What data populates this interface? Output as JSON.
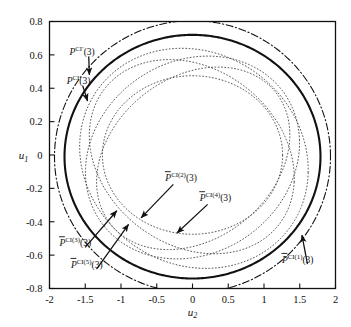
{
  "chart_data": {
    "type": "line",
    "title": "",
    "xlabel": "u2",
    "ylabel": "u1",
    "xlim": [
      -2,
      2
    ],
    "ylim": [
      -0.8,
      0.8
    ],
    "grid": false,
    "legend_position": "inline-annotations",
    "xticks": [
      "-2",
      "-1.5",
      "-1",
      "-0.5",
      "0",
      "0.5",
      "1",
      "1.5",
      "2"
    ],
    "xtick_values": [
      -2,
      -1.5,
      -1,
      -0.5,
      0,
      0.5,
      1,
      1.5,
      2
    ],
    "yticks": [
      "0.8",
      "0.6",
      "0.4",
      "0.2",
      "0",
      "-0.2",
      "-0.4",
      "-0.6",
      "-0.8"
    ],
    "ytick_values": [
      0.8,
      0.6,
      0.4,
      0.2,
      0,
      -0.2,
      -0.4,
      -0.6,
      -0.8
    ],
    "series": [
      {
        "name": "P^CI'(3)",
        "style": "dash-dot",
        "color": "#111111",
        "width": 1.1,
        "description": "outermost envelope, semi-axes a=1.93 b=0.815",
        "ellipse": {
          "cx": 0.0,
          "cy": -0.01,
          "rx": 1.93,
          "ry": 0.815,
          "rot": 0
        }
      },
      {
        "name": "P^CI(3)",
        "style": "solid",
        "color": "#111111",
        "width": 2.1,
        "description": "heavy solid inner envelope, semi-axes a=1.79 b=0.73",
        "ellipse": {
          "cx": 0.0,
          "cy": -0.01,
          "rx": 1.79,
          "ry": 0.73,
          "rot": 0
        }
      },
      {
        "name": "Pbar^CI(1)(3)",
        "style": "dotted",
        "color": "#444444",
        "width": 0.9,
        "ellipse": {
          "cx": 0.02,
          "cy": -0.02,
          "rx": 1.6,
          "ry": 0.655,
          "rot": -3
        }
      },
      {
        "name": "Pbar^CI(2)(3)",
        "style": "dotted",
        "color": "#444444",
        "width": 0.9,
        "ellipse": {
          "cx": 0.0,
          "cy": -0.015,
          "rx": 1.5,
          "ry": 0.6,
          "rot": 4
        }
      },
      {
        "name": "Pbar^CI(3)(3)",
        "style": "dotted",
        "color": "#444444",
        "width": 0.9,
        "ellipse": {
          "cx": -0.01,
          "cy": -0.01,
          "rx": 1.44,
          "ry": 0.565,
          "rot": -6
        }
      },
      {
        "name": "Pbar^CI(4)(3)",
        "style": "dotted",
        "color": "#444444",
        "width": 0.9,
        "ellipse": {
          "cx": 0.01,
          "cy": -0.02,
          "rx": 1.36,
          "ry": 0.525,
          "rot": 7
        }
      },
      {
        "name": "Pbar^CI(5)(3)",
        "style": "dotted",
        "color": "#444444",
        "width": 0.9,
        "ellipse": {
          "cx": 0.0,
          "cy": 0.0,
          "rx": 1.26,
          "ry": 0.475,
          "rot": 0
        }
      }
    ],
    "annotations": [
      {
        "id": "a1",
        "base": "P",
        "sup": "CI′",
        "arg": "(3)",
        "overbar": false,
        "text": "P^CI'(3)",
        "label_xy": [
          -1.72,
          0.6
        ],
        "arrow_to": [
          -1.44,
          0.455
        ]
      },
      {
        "id": "a2",
        "base": "P",
        "sup": "CI",
        "arg": "(3)",
        "overbar": false,
        "text": "P^CI(3)",
        "label_xy": [
          -1.76,
          0.425
        ],
        "arrow_to": [
          -1.45,
          0.3
        ]
      },
      {
        "id": "a3",
        "base": "P",
        "sup": "CI(2)",
        "arg": "(3)",
        "overbar": true,
        "text": "Pbar^CI(2)(3)",
        "label_xy": [
          -0.38,
          -0.155
        ],
        "arrow_to": [
          -0.76,
          -0.395
        ]
      },
      {
        "id": "a4",
        "base": "P",
        "sup": "CI(4)",
        "arg": "(3)",
        "overbar": true,
        "text": "Pbar^CI(4)(3)",
        "label_xy": [
          0.1,
          -0.275
        ],
        "arrow_to": [
          -0.26,
          -0.485
        ]
      },
      {
        "id": "a5",
        "base": "P",
        "sup": "CI(3)",
        "arg": "(3)",
        "overbar": true,
        "text": "Pbar^CI(3)(3)",
        "label_xy": [
          -1.86,
          -0.545
        ],
        "arrow_to": [
          -1.02,
          -0.315
        ]
      },
      {
        "id": "a6",
        "base": "P",
        "sup": "CI(5)",
        "arg": "(3)",
        "overbar": true,
        "text": "Pbar^CI(5)(3)",
        "label_xy": [
          -1.7,
          -0.675
        ],
        "arrow_to": [
          -0.86,
          -0.395
        ]
      },
      {
        "id": "a7",
        "base": "P",
        "sup": "CI(1)",
        "arg": "(3)",
        "overbar": true,
        "text": "Pbar^CI(1)(3)",
        "label_xy": [
          1.25,
          -0.645
        ],
        "arrow_to": [
          1.52,
          -0.455
        ]
      }
    ]
  },
  "axes": {
    "x_title": "u",
    "x_title_sub": "2",
    "y_title": "u",
    "y_title_sub": "1"
  },
  "labels": {
    "a1": {
      "base": "P",
      "sup": "CI′",
      "arg": "(3)"
    },
    "a2": {
      "base": "P",
      "sup": "CI",
      "arg": "(3)"
    },
    "a3": {
      "base": "P",
      "sup": "CI(2)",
      "arg": "(3)"
    },
    "a4": {
      "base": "P",
      "sup": "CI(4)",
      "arg": "(3)"
    },
    "a5": {
      "base": "P",
      "sup": "CI(3)",
      "arg": "(3)"
    },
    "a6": {
      "base": "P",
      "sup": "CI(5)",
      "arg": "(3)"
    },
    "a7": {
      "base": "P",
      "sup": "CI(1)",
      "arg": "(3)"
    }
  },
  "colors": {
    "frame": "#111111",
    "solid_curve": "#111111",
    "dotted_curve": "#444444",
    "background": "#ffffff"
  }
}
